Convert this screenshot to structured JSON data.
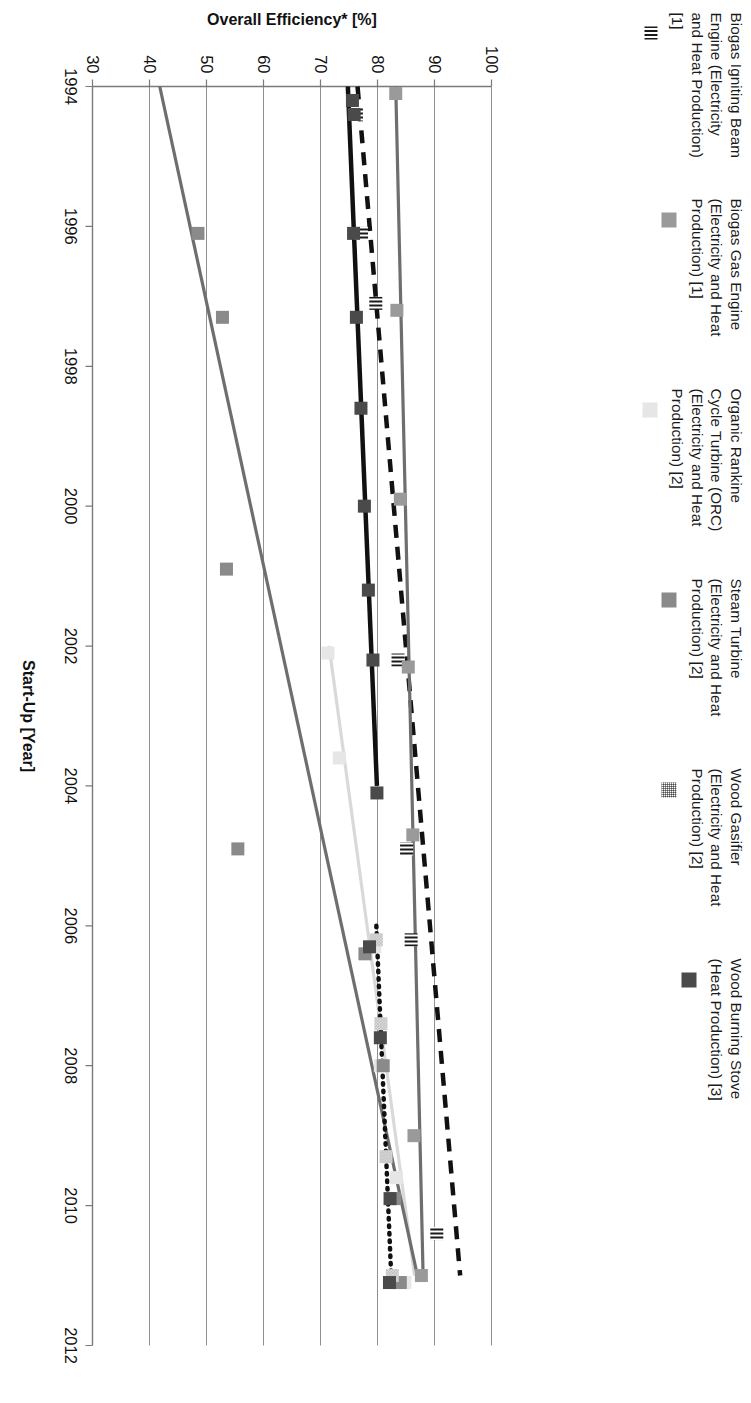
{
  "figure": {
    "rotation_note": "figure rendered rotated 90 degrees clockwise in the screenshot"
  },
  "legend": {
    "position": "top",
    "items": [
      {
        "label": "Biogas Igniting Beam\nEngine (Electricity\nand Heat Production)\n[1]",
        "key": "stripe",
        "color": "#1a1a1a"
      },
      {
        "label": "Biogas Gas Engine\n(Electricity and Heat\nProduction) [1]",
        "key": "mid",
        "color": "#9a9a9a"
      },
      {
        "label": "Organic Rankine\nCycle Turbine (ORC)\n(Electricity and Heat\nProduction) [2]",
        "key": "light",
        "color": "#e6e6e6"
      },
      {
        "label": "Steam Turbine\n(Electricity and Heat\nProduction) [2]",
        "key": "steam",
        "color": "#8a8a8a"
      },
      {
        "label": "Wood Gasifier\n(Electricity and Heat\nProduction) [2]",
        "key": "hatch",
        "color": "#8c8c8c"
      },
      {
        "label": "Wood Burning Stove\n(Heat Production) [3]",
        "key": "dark",
        "color": "#4a4a4a"
      }
    ]
  },
  "chart_data": {
    "type": "scatter",
    "title": "",
    "xlabel": "Start-Up [Year]",
    "ylabel": "Overall Efficiency* [%]",
    "xlim": [
      1994,
      2012
    ],
    "ylim": [
      30,
      100
    ],
    "xticks": [
      1994,
      1996,
      1998,
      2000,
      2002,
      2004,
      2006,
      2008,
      2010,
      2012
    ],
    "yticks": [
      30,
      40,
      50,
      60,
      70,
      80,
      90,
      100
    ],
    "grid": "vertical gridlines at each y tick (horizontal in rotated view)",
    "legend_position": "top",
    "series": [
      {
        "name": "Biogas Igniting Beam Engine (Electricity and Heat Production) [1]",
        "marker": "stripe",
        "color": "#1a1a1a",
        "trendline": {
          "style": "dashed",
          "color": "#111111",
          "x": [
            1994,
            2011
          ],
          "y": [
            76.5,
            94.5
          ]
        },
        "points": [
          {
            "x": 1994.4,
            "y": 76.3
          },
          {
            "x": 1996.1,
            "y": 77.2
          },
          {
            "x": 1997.1,
            "y": 79.7
          },
          {
            "x": 2002.2,
            "y": 83.6
          },
          {
            "x": 2004.9,
            "y": 85.1
          },
          {
            "x": 2006.2,
            "y": 85.9
          },
          {
            "x": 2010.4,
            "y": 90.4
          }
        ]
      },
      {
        "name": "Biogas Gas Engine (Electricity and Heat Production) [1]",
        "marker": "square",
        "color": "#9a9a9a",
        "trendline": {
          "style": "solid",
          "color": "#6e6e6e",
          "x": [
            1994,
            2011
          ],
          "y": [
            83.2,
            88.0
          ]
        },
        "points": [
          {
            "x": 1994.1,
            "y": 83.2
          },
          {
            "x": 1997.2,
            "y": 83.4
          },
          {
            "x": 1999.9,
            "y": 84.0
          },
          {
            "x": 2002.3,
            "y": 85.4
          },
          {
            "x": 2004.7,
            "y": 86.2
          },
          {
            "x": 2009.0,
            "y": 86.4
          },
          {
            "x": 2011.0,
            "y": 87.7
          }
        ]
      },
      {
        "name": "Organic Rankine Cycle Turbine (ORC) (Electricity and Heat Production) [2]",
        "marker": "square",
        "color": "#e6e6e6",
        "trendline": {
          "style": "solid",
          "color": "#d9d9d9",
          "x": [
            2002,
            2011
          ],
          "y": [
            71.5,
            86.5
          ]
        },
        "points": [
          {
            "x": 2002.1,
            "y": 71.3
          },
          {
            "x": 2003.6,
            "y": 73.3
          },
          {
            "x": 2006.3,
            "y": 79.5
          },
          {
            "x": 2008.0,
            "y": 80.5
          },
          {
            "x": 2009.6,
            "y": 83.3
          },
          {
            "x": 2011.1,
            "y": 84.8
          }
        ]
      },
      {
        "name": "Steam Turbine (Electricity and Heat Production) [2]",
        "marker": "square",
        "color": "#8a8a8a",
        "trendline": {
          "style": "solid",
          "color": "#6e6e6e",
          "x": [
            1994,
            2011
          ],
          "y": [
            41.8,
            87.0
          ]
        },
        "points": [
          {
            "x": 1996.1,
            "y": 48.5
          },
          {
            "x": 1997.3,
            "y": 52.8
          },
          {
            "x": 2000.9,
            "y": 53.5
          },
          {
            "x": 2004.9,
            "y": 55.5
          },
          {
            "x": 2006.4,
            "y": 77.8
          },
          {
            "x": 2008.0,
            "y": 81.0
          },
          {
            "x": 2009.9,
            "y": 83.0
          },
          {
            "x": 2011.1,
            "y": 84.0
          }
        ]
      },
      {
        "name": "Wood Gasifier (Electricity and Heat Production) [2]",
        "marker": "hatch",
        "color": "#8c8c8c",
        "trendline": {
          "style": "dotted",
          "color": "#111111",
          "x": [
            2006,
            2011
          ],
          "y": [
            79.8,
            82.4
          ]
        },
        "points": [
          {
            "x": 2006.2,
            "y": 79.8
          },
          {
            "x": 2007.4,
            "y": 80.6
          },
          {
            "x": 2009.3,
            "y": 81.5
          },
          {
            "x": 2011.0,
            "y": 82.6
          }
        ]
      },
      {
        "name": "Wood Burning Stove (Heat Production) [3]",
        "marker": "square",
        "color": "#4a4a4a",
        "trendline": {
          "style": "solid",
          "color": "#111111",
          "x": [
            1994,
            2004
          ],
          "y": [
            74.8,
            79.9
          ]
        },
        "points": [
          {
            "x": 1994.2,
            "y": 75.6
          },
          {
            "x": 1994.4,
            "y": 75.9
          },
          {
            "x": 1996.1,
            "y": 75.8
          },
          {
            "x": 1997.3,
            "y": 76.3
          },
          {
            "x": 1998.6,
            "y": 77.1
          },
          {
            "x": 2000.0,
            "y": 77.7
          },
          {
            "x": 2001.2,
            "y": 78.4
          },
          {
            "x": 2002.2,
            "y": 79.2
          },
          {
            "x": 2004.1,
            "y": 79.9
          },
          {
            "x": 2006.3,
            "y": 78.6
          },
          {
            "x": 2007.6,
            "y": 80.5
          },
          {
            "x": 2009.9,
            "y": 82.2
          },
          {
            "x": 2011.1,
            "y": 82.1
          }
        ]
      }
    ]
  }
}
